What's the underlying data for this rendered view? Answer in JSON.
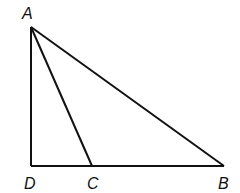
{
  "diagram": {
    "type": "triangle",
    "stroke_color": "#111111",
    "background": "#ffffff",
    "points": {
      "A": {
        "label": "A",
        "x": 31,
        "y": 27
      },
      "B": {
        "label": "B",
        "x": 224,
        "y": 166
      },
      "C": {
        "label": "C",
        "x": 92,
        "y": 166
      },
      "D": {
        "label": "D",
        "x": 31,
        "y": 166
      }
    },
    "segments": [
      "AD",
      "DB",
      "AB",
      "AC"
    ]
  }
}
